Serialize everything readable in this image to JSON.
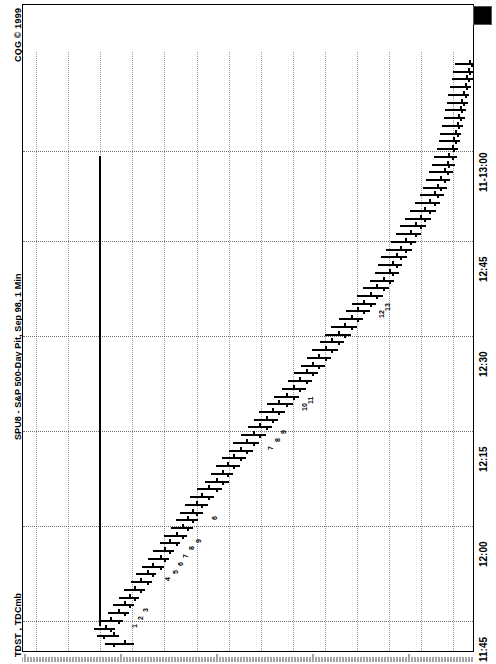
{
  "window": {
    "copyright": "CQG © 1999",
    "title": "SPU8 - S&P 500-Day Pit, Sep 98, 1 Min",
    "study_label": "TDST ,  TDCmb",
    "corner_widget": "black-square-marker"
  },
  "axes": {
    "price_axis": {
      "labels": [
        "107200",
        "107100",
        "107000",
        "106900",
        "106800",
        "106700",
        "106600",
        "106500",
        "106400",
        "106300",
        "106200",
        "106100",
        "106000",
        "105900"
      ],
      "min": 105850,
      "max": 107250,
      "tick_step": 100
    },
    "time_axis": {
      "labels": [
        "11-13:00",
        "12:45",
        "12:30",
        "12:15",
        "12:00",
        "11:45"
      ],
      "start": "11:45",
      "end": "13:00",
      "interval": "1 Min"
    }
  },
  "chart_data": {
    "type": "bar",
    "title": "SPU8 - S&P 500-Day Pit, Sep 98, 1 Min",
    "subtitle": "CQG © 1999",
    "xlabel": "Price",
    "ylabel": "Time",
    "orientation": "rotated-90",
    "grid": true,
    "legend": "none",
    "ylim": [
      105850,
      107250
    ],
    "tdst_line_level": 107005,
    "bars": [
      {
        "t": "11:45",
        "o": 106925,
        "h": 106985,
        "l": 106895,
        "c": 106960,
        "td": null
      },
      {
        "t": "11:46",
        "o": 106960,
        "h": 107010,
        "l": 106940,
        "c": 106990,
        "td": null
      },
      {
        "t": "11:47",
        "o": 106985,
        "h": 107020,
        "l": 106955,
        "c": 106970,
        "td": null
      },
      {
        "t": "11:48",
        "o": 106970,
        "h": 107005,
        "l": 106930,
        "c": 106945,
        "td": "1"
      },
      {
        "t": "11:49",
        "o": 106945,
        "h": 106975,
        "l": 106910,
        "c": 106925,
        "td": "2"
      },
      {
        "t": "11:50",
        "o": 106925,
        "h": 106960,
        "l": 106895,
        "c": 106910,
        "td": "3"
      },
      {
        "t": "11:51",
        "o": 106910,
        "h": 106940,
        "l": 106880,
        "c": 106895,
        "td": null
      },
      {
        "t": "11:52",
        "o": 106895,
        "h": 106925,
        "l": 106860,
        "c": 106875,
        "td": null
      },
      {
        "t": "11:53",
        "o": 106875,
        "h": 106905,
        "l": 106840,
        "c": 106855,
        "td": null
      },
      {
        "t": "11:54",
        "o": 106855,
        "h": 106890,
        "l": 106825,
        "c": 106840,
        "td": "4"
      },
      {
        "t": "11:55",
        "o": 106840,
        "h": 106870,
        "l": 106800,
        "c": 106815,
        "td": "5"
      },
      {
        "t": "11:56",
        "o": 106815,
        "h": 106850,
        "l": 106785,
        "c": 106800,
        "td": "6"
      },
      {
        "t": "11:57",
        "o": 106800,
        "h": 106835,
        "l": 106770,
        "c": 106785,
        "td": "7"
      },
      {
        "t": "11:58",
        "o": 106785,
        "h": 106815,
        "l": 106750,
        "c": 106765,
        "td": "8"
      },
      {
        "t": "11:59",
        "o": 106765,
        "h": 106800,
        "l": 106730,
        "c": 106745,
        "td": "9"
      },
      {
        "t": "12:00",
        "o": 106745,
        "h": 106780,
        "l": 106710,
        "c": 106730,
        "td": null
      },
      {
        "t": "12:01",
        "o": 106730,
        "h": 106765,
        "l": 106695,
        "c": 106715,
        "td": null
      },
      {
        "t": "12:02",
        "o": 106715,
        "h": 106750,
        "l": 106680,
        "c": 106700,
        "td": "6"
      },
      {
        "t": "12:03",
        "o": 106700,
        "h": 106735,
        "l": 106665,
        "c": 106685,
        "td": null
      },
      {
        "t": "12:04",
        "o": 106685,
        "h": 106720,
        "l": 106645,
        "c": 106665,
        "td": null
      },
      {
        "t": "12:05",
        "o": 106665,
        "h": 106700,
        "l": 106620,
        "c": 106640,
        "td": null
      },
      {
        "t": "12:06",
        "o": 106640,
        "h": 106675,
        "l": 106600,
        "c": 106620,
        "td": null
      },
      {
        "t": "12:07",
        "o": 106620,
        "h": 106655,
        "l": 106585,
        "c": 106605,
        "td": null
      },
      {
        "t": "12:08",
        "o": 106605,
        "h": 106640,
        "l": 106565,
        "c": 106585,
        "td": null
      },
      {
        "t": "12:09",
        "o": 106585,
        "h": 106620,
        "l": 106545,
        "c": 106565,
        "td": null
      },
      {
        "t": "12:10",
        "o": 106565,
        "h": 106600,
        "l": 106525,
        "c": 106545,
        "td": null
      },
      {
        "t": "12:11",
        "o": 106545,
        "h": 106585,
        "l": 106505,
        "c": 106525,
        "td": "7"
      },
      {
        "t": "12:12",
        "o": 106525,
        "h": 106560,
        "l": 106485,
        "c": 106505,
        "td": "8"
      },
      {
        "t": "12:13",
        "o": 106505,
        "h": 106540,
        "l": 106465,
        "c": 106485,
        "td": "9"
      },
      {
        "t": "12:14",
        "o": 106485,
        "h": 106520,
        "l": 106445,
        "c": 106465,
        "td": null
      },
      {
        "t": "12:15",
        "o": 106465,
        "h": 106505,
        "l": 106425,
        "c": 106445,
        "td": null
      },
      {
        "t": "12:16",
        "o": 106445,
        "h": 106480,
        "l": 106400,
        "c": 106420,
        "td": "10"
      },
      {
        "t": "12:17",
        "o": 106420,
        "h": 106460,
        "l": 106380,
        "c": 106400,
        "td": "11"
      },
      {
        "t": "12:18",
        "o": 106400,
        "h": 106435,
        "l": 106360,
        "c": 106380,
        "td": null
      },
      {
        "t": "12:19",
        "o": 106380,
        "h": 106415,
        "l": 106340,
        "c": 106360,
        "td": null
      },
      {
        "t": "12:20",
        "o": 106360,
        "h": 106395,
        "l": 106320,
        "c": 106340,
        "td": null
      },
      {
        "t": "12:21",
        "o": 106340,
        "h": 106375,
        "l": 106300,
        "c": 106320,
        "td": null
      },
      {
        "t": "12:22",
        "o": 106320,
        "h": 106355,
        "l": 106280,
        "c": 106300,
        "td": null
      },
      {
        "t": "12:23",
        "o": 106300,
        "h": 106340,
        "l": 106260,
        "c": 106280,
        "td": null
      },
      {
        "t": "12:24",
        "o": 106280,
        "h": 106315,
        "l": 106240,
        "c": 106260,
        "td": null
      },
      {
        "t": "12:25",
        "o": 106260,
        "h": 106300,
        "l": 106220,
        "c": 106240,
        "td": null
      },
      {
        "t": "12:26",
        "o": 106240,
        "h": 106280,
        "l": 106200,
        "c": 106220,
        "td": null
      },
      {
        "t": "12:27",
        "o": 106220,
        "h": 106255,
        "l": 106180,
        "c": 106200,
        "td": null
      },
      {
        "t": "12:28",
        "o": 106200,
        "h": 106235,
        "l": 106160,
        "c": 106180,
        "td": "12"
      },
      {
        "t": "12:29",
        "o": 106180,
        "h": 106215,
        "l": 106140,
        "c": 106160,
        "td": "13"
      },
      {
        "t": "12:30",
        "o": 106160,
        "h": 106200,
        "l": 106120,
        "c": 106140,
        "td": null
      },
      {
        "t": "12:31",
        "o": 106140,
        "h": 106180,
        "l": 106100,
        "c": 106120,
        "td": null
      },
      {
        "t": "12:32",
        "o": 106120,
        "h": 106160,
        "l": 106085,
        "c": 106100,
        "td": null
      },
      {
        "t": "12:33",
        "o": 106100,
        "h": 106145,
        "l": 106070,
        "c": 106090,
        "td": null
      },
      {
        "t": "12:34",
        "o": 106090,
        "h": 106135,
        "l": 106060,
        "c": 106080,
        "td": null
      },
      {
        "t": "12:35",
        "o": 106080,
        "h": 106125,
        "l": 106045,
        "c": 106065,
        "td": null
      },
      {
        "t": "12:36",
        "o": 106065,
        "h": 106110,
        "l": 106030,
        "c": 106050,
        "td": null
      },
      {
        "t": "12:37",
        "o": 106050,
        "h": 106095,
        "l": 106015,
        "c": 106035,
        "td": null
      },
      {
        "t": "12:38",
        "o": 106035,
        "h": 106080,
        "l": 106000,
        "c": 106020,
        "td": null
      },
      {
        "t": "12:39",
        "o": 106020,
        "h": 106065,
        "l": 105985,
        "c": 106005,
        "td": null
      },
      {
        "t": "12:40",
        "o": 106005,
        "h": 106050,
        "l": 105970,
        "c": 105990,
        "td": null
      },
      {
        "t": "12:41",
        "o": 105990,
        "h": 106035,
        "l": 105955,
        "c": 105975,
        "td": null
      },
      {
        "t": "12:42",
        "o": 105975,
        "h": 106020,
        "l": 105940,
        "c": 105960,
        "td": null
      },
      {
        "t": "12:43",
        "o": 105960,
        "h": 106005,
        "l": 105930,
        "c": 105950,
        "td": null
      },
      {
        "t": "12:44",
        "o": 105950,
        "h": 105995,
        "l": 105920,
        "c": 105940,
        "td": null
      },
      {
        "t": "12:45",
        "o": 105940,
        "h": 105985,
        "l": 105910,
        "c": 105930,
        "td": null
      },
      {
        "t": "12:46",
        "o": 105930,
        "h": 105975,
        "l": 105900,
        "c": 105920,
        "td": null
      },
      {
        "t": "12:47",
        "o": 105920,
        "h": 105965,
        "l": 105895,
        "c": 105915,
        "td": null
      },
      {
        "t": "12:48",
        "o": 105915,
        "h": 105960,
        "l": 105890,
        "c": 105905,
        "td": null
      },
      {
        "t": "12:49",
        "o": 105905,
        "h": 105950,
        "l": 105885,
        "c": 105900,
        "td": null
      },
      {
        "t": "12:50",
        "o": 105900,
        "h": 105945,
        "l": 105880,
        "c": 105895,
        "td": null
      },
      {
        "t": "12:51",
        "o": 105895,
        "h": 105940,
        "l": 105875,
        "c": 105890,
        "td": null
      },
      {
        "t": "12:52",
        "o": 105890,
        "h": 105935,
        "l": 105870,
        "c": 105885,
        "td": null
      },
      {
        "t": "12:53",
        "o": 105885,
        "h": 105930,
        "l": 105865,
        "c": 105880,
        "td": null
      },
      {
        "t": "12:54",
        "o": 105880,
        "h": 105925,
        "l": 105860,
        "c": 105875,
        "td": null
      },
      {
        "t": "12:55",
        "o": 105875,
        "h": 105920,
        "l": 105855,
        "c": 105870,
        "td": null
      },
      {
        "t": "12:56",
        "o": 105870,
        "h": 105915,
        "l": 105850,
        "c": 105865,
        "td": null
      },
      {
        "t": "12:57",
        "o": 105865,
        "h": 105910,
        "l": 105845,
        "c": 105860,
        "td": null
      },
      {
        "t": "12:58",
        "o": 105860,
        "h": 105905,
        "l": 105840,
        "c": 105855,
        "td": null
      },
      {
        "t": "12:59",
        "o": 105855,
        "h": 105900,
        "l": 105835,
        "c": 105850,
        "td": null
      },
      {
        "t": "13:00",
        "o": 105850,
        "h": 105895,
        "l": 105830,
        "c": 105845,
        "td": null
      }
    ]
  },
  "colors": {
    "background": "#ffffff",
    "ink": "#000000",
    "grid": "#9a9a9a",
    "frame": "#000000"
  }
}
